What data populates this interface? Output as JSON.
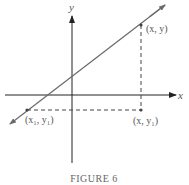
{
  "figure": {
    "caption": "FIGURE 6",
    "axes": {
      "x_label": "x",
      "y_label": "y"
    },
    "points": [
      {
        "id": "p_xy",
        "label": "(x, y)"
      },
      {
        "id": "p_x1y1",
        "label": "(x₁, y₁)"
      },
      {
        "id": "p_xy1",
        "label": "(x, y₁)"
      }
    ],
    "colors": {
      "axis": "#222222",
      "line": "#6a6a6a",
      "dashed": "#444444",
      "text": "#555555"
    }
  }
}
